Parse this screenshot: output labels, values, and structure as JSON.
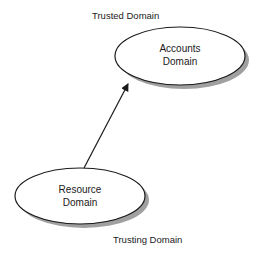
{
  "diagram": {
    "labels": {
      "trusted": "Trusted Domain",
      "trusting": "Trusting Domain"
    },
    "nodes": [
      {
        "id": "accounts",
        "line1": "Accounts",
        "line2": "Domain",
        "role": "trusted"
      },
      {
        "id": "resource",
        "line1": "Resource",
        "line2": "Domain",
        "role": "trusting"
      }
    ],
    "edges": [
      {
        "from": "resource",
        "to": "accounts",
        "type": "arrow"
      }
    ],
    "colors": {
      "stroke": "#1a1a1a",
      "fill": "#ffffff",
      "shadow": "#9a9a9a"
    }
  }
}
